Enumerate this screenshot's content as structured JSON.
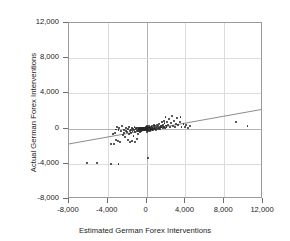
{
  "chart_data": {
    "type": "scatter",
    "title": "",
    "xlabel": "Estimated German Forex Interventions",
    "ylabel": "Actual German Forex Interventions",
    "xlim": [
      -8000,
      12000
    ],
    "ylim": [
      -8000,
      12000
    ],
    "xticks": [
      -8000,
      -4000,
      0,
      4000,
      8000,
      12000
    ],
    "yticks": [
      -8000,
      -4000,
      0,
      4000,
      8000,
      12000
    ],
    "xtick_labels": [
      "-8,000",
      "-4,000",
      "0",
      "4,000",
      "8,000",
      "12,000"
    ],
    "ytick_labels": [
      "-8,000",
      "-4,000",
      "0",
      "4,000",
      "8,000",
      "12,000"
    ],
    "grid": true,
    "legend": null,
    "marker_color": "#262626",
    "line_color": "#6e6e6e",
    "frame_color": "#9a9a9a",
    "grid_color": "#dcdcdc",
    "trend_line": {
      "type": "linear-fit",
      "x": [
        -8000,
        12000
      ],
      "y": [
        -1900,
        2050
      ]
    },
    "points": [
      [
        -6100,
        -3950
      ],
      [
        -5100,
        -3950
      ],
      [
        -3700,
        -4050
      ],
      [
        -2900,
        -4050
      ],
      [
        -3650,
        -1700
      ],
      [
        -3400,
        -1750
      ],
      [
        -3150,
        -1250
      ],
      [
        -2950,
        -1400
      ],
      [
        -2700,
        -1500
      ],
      [
        -3500,
        -600
      ],
      [
        -3300,
        -450
      ],
      [
        -3150,
        -100
      ],
      [
        -3050,
        150
      ],
      [
        -2900,
        -200
      ],
      [
        -2800,
        100
      ],
      [
        -2600,
        -300
      ],
      [
        -2500,
        250
      ],
      [
        -2450,
        -750
      ],
      [
        -2350,
        -500
      ],
      [
        -2300,
        -120
      ],
      [
        -2200,
        -950
      ],
      [
        -2150,
        -250
      ],
      [
        -2100,
        60
      ],
      [
        -2000,
        -420
      ],
      [
        -1950,
        -1250
      ],
      [
        -1900,
        -80
      ],
      [
        -1850,
        -650
      ],
      [
        -1800,
        180
      ],
      [
        -1750,
        -300
      ],
      [
        -1700,
        -1500
      ],
      [
        -1650,
        -130
      ],
      [
        -1600,
        -550
      ],
      [
        -1550,
        80
      ],
      [
        -1500,
        -1400
      ],
      [
        -1450,
        -260
      ],
      [
        -1400,
        -60
      ],
      [
        -1350,
        -800
      ],
      [
        -1300,
        -180
      ],
      [
        -1250,
        140
      ],
      [
        -1200,
        -1550
      ],
      [
        -1150,
        -400
      ],
      [
        -1100,
        -90
      ],
      [
        -1050,
        60
      ],
      [
        -1000,
        -1200
      ],
      [
        -980,
        -300
      ],
      [
        -950,
        30
      ],
      [
        -900,
        -150
      ],
      [
        -870,
        -600
      ],
      [
        -840,
        100
      ],
      [
        -800,
        -70
      ],
      [
        -780,
        -250
      ],
      [
        -750,
        50
      ],
      [
        -720,
        -420
      ],
      [
        -700,
        -40
      ],
      [
        -680,
        120
      ],
      [
        -650,
        -180
      ],
      [
        -620,
        10
      ],
      [
        -600,
        -330
      ],
      [
        -580,
        70
      ],
      [
        -550,
        -110
      ],
      [
        -520,
        30
      ],
      [
        -500,
        -220
      ],
      [
        -470,
        90
      ],
      [
        -450,
        -60
      ],
      [
        -430,
        20
      ],
      [
        -400,
        -150
      ],
      [
        -380,
        60
      ],
      [
        -350,
        -40
      ],
      [
        -330,
        100
      ],
      [
        -300,
        -90
      ],
      [
        -280,
        30
      ],
      [
        -260,
        -200
      ],
      [
        -240,
        70
      ],
      [
        -220,
        -30
      ],
      [
        -200,
        40
      ],
      [
        -180,
        -120
      ],
      [
        -160,
        80
      ],
      [
        -140,
        -50
      ],
      [
        -120,
        20
      ],
      [
        -100,
        110
      ],
      [
        -90,
        -70
      ],
      [
        -80,
        50
      ],
      [
        -70,
        -20
      ],
      [
        -60,
        90
      ],
      [
        -50,
        -110
      ],
      [
        -45,
        30
      ],
      [
        -40,
        160
      ],
      [
        -35,
        -40
      ],
      [
        -30,
        60
      ],
      [
        -25,
        -150
      ],
      [
        -20,
        20
      ],
      [
        -15,
        100
      ],
      [
        -10,
        -60
      ],
      [
        -5,
        40
      ],
      [
        0,
        -10
      ],
      [
        0,
        130
      ],
      [
        0,
        -200
      ],
      [
        0,
        70
      ],
      [
        0,
        200
      ],
      [
        0,
        -90
      ],
      [
        0,
        280
      ],
      [
        0,
        -350
      ],
      [
        10,
        40
      ],
      [
        20,
        -130
      ],
      [
        30,
        90
      ],
      [
        50,
        -40
      ],
      [
        60,
        180
      ],
      [
        80,
        -80
      ],
      [
        100,
        30
      ],
      [
        120,
        -250
      ],
      [
        150,
        120
      ],
      [
        180,
        -3300
      ],
      [
        200,
        60
      ],
      [
        220,
        -180
      ],
      [
        250,
        280
      ],
      [
        280,
        -60
      ],
      [
        300,
        150
      ],
      [
        330,
        -320
      ],
      [
        350,
        50
      ],
      [
        380,
        200
      ],
      [
        400,
        -110
      ],
      [
        430,
        90
      ],
      [
        460,
        -40
      ],
      [
        500,
        330
      ],
      [
        530,
        -200
      ],
      [
        560,
        110
      ],
      [
        600,
        -70
      ],
      [
        640,
        250
      ],
      [
        680,
        -150
      ],
      [
        700,
        60
      ],
      [
        740,
        400
      ],
      [
        780,
        -90
      ],
      [
        820,
        180
      ],
      [
        860,
        -40
      ],
      [
        900,
        300
      ],
      [
        950,
        80
      ],
      [
        1000,
        -120
      ],
      [
        1050,
        420
      ],
      [
        1100,
        150
      ],
      [
        1150,
        -60
      ],
      [
        1200,
        260
      ],
      [
        1250,
        60
      ],
      [
        1300,
        520
      ],
      [
        1350,
        180
      ],
      [
        1400,
        -80
      ],
      [
        1450,
        340
      ],
      [
        1500,
        120
      ],
      [
        1550,
        700
      ],
      [
        1600,
        260
      ],
      [
        1650,
        40
      ],
      [
        1700,
        420
      ],
      [
        1750,
        900
      ],
      [
        1800,
        180
      ],
      [
        1850,
        620
      ],
      [
        1900,
        80
      ],
      [
        1950,
        1300
      ],
      [
        2000,
        350
      ],
      [
        2050,
        160
      ],
      [
        2100,
        760
      ],
      [
        2200,
        420
      ],
      [
        2300,
        1050
      ],
      [
        2400,
        200
      ],
      [
        2500,
        640
      ],
      [
        2600,
        1450
      ],
      [
        2700,
        330
      ],
      [
        2800,
        840
      ],
      [
        2900,
        160
      ],
      [
        3000,
        560
      ],
      [
        3100,
        1200
      ],
      [
        3200,
        380
      ],
      [
        3400,
        700
      ],
      [
        3500,
        1350
      ],
      [
        3600,
        220
      ],
      [
        3800,
        520
      ],
      [
        4000,
        150
      ],
      [
        4100,
        380
      ],
      [
        4300,
        80
      ],
      [
        4500,
        260
      ],
      [
        9200,
        700
      ],
      [
        10400,
        320
      ]
    ]
  }
}
